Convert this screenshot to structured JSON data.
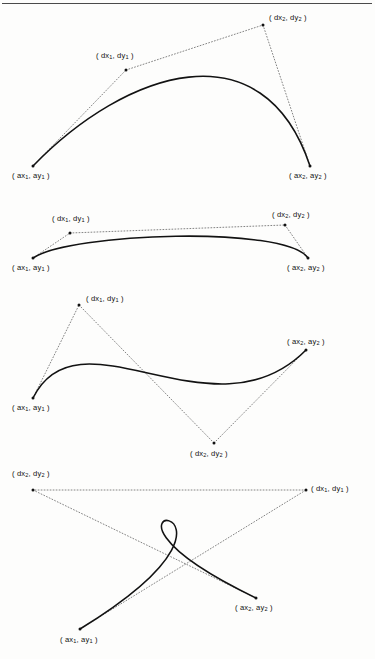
{
  "page": {
    "background_color": "#fdfdfc",
    "ink_color": "#121212",
    "has_top_rule": true
  },
  "labels": {
    "anchor1": "( ax<sub>1</sub>, ay<sub>1</sub> )",
    "anchor2": "( ax<sub>2</sub>, ay<sub>2</sub> )",
    "control1": "( dx<sub>1</sub>, dy<sub>1</sub> )",
    "control2": "( dx<sub>2</sub>, dy<sub>2</sub> )"
  },
  "figures": [
    {
      "id": "figure-1",
      "name": "arch-curve",
      "description": "Bezier arch with both control points above the curve",
      "points": {
        "anchor1": [
          33,
          166
        ],
        "control1": [
          126,
          70
        ],
        "control2": [
          263,
          25
        ],
        "anchor2": [
          310,
          166
        ]
      },
      "label_positions": {
        "anchor1": [
          12,
          172
        ],
        "control1": [
          96,
          52
        ],
        "control2": [
          269,
          14
        ],
        "anchor2": [
          289,
          172
        ]
      },
      "curve_path": "M 33 166 C 126 70 263 25 310 166",
      "tangent1": "M 33 166 L 126 70",
      "hull_line": "M 126 70 L 263 25",
      "tangent2": "M 263 25 L 310 166"
    },
    {
      "id": "figure-2",
      "name": "shallow-arc-curve",
      "description": "Shallow Bezier arc with control points just above the endpoints",
      "points": {
        "anchor1": [
          33,
          258
        ],
        "control1": [
          70,
          233
        ],
        "control2": [
          285,
          225
        ],
        "anchor2": [
          308,
          258
        ]
      },
      "label_positions": {
        "anchor1": [
          12,
          264
        ],
        "control1": [
          52,
          215
        ],
        "control2": [
          272,
          211
        ],
        "anchor2": [
          287,
          264
        ]
      },
      "curve_path": "M 33 258 C 70 233 285 225 308 258",
      "tangent1": "M 33 258 L 70 233",
      "hull_line": "M 70 233 L 285 225",
      "tangent2": "M 285 225 L 308 258"
    },
    {
      "id": "figure-3",
      "name": "s-curve",
      "description": "S-shaped Bezier with first control point above and second control point below",
      "points": {
        "anchor1": [
          33,
          398
        ],
        "control1": [
          79,
          305
        ],
        "control2": [
          214,
          443
        ],
        "anchor2": [
          306,
          350
        ]
      },
      "label_positions": {
        "anchor1": [
          12,
          404
        ],
        "control1": [
          86,
          295
        ],
        "control2": [
          190,
          450
        ],
        "anchor2": [
          287,
          338
        ]
      },
      "curve_path": "M 33 398 C 79 305 214 443 306 350",
      "tangent1": "M 33 398 L 79 305",
      "hull_line": "M 79 305 L 214 443",
      "tangent2": "M 214 443 L 306 350"
    },
    {
      "id": "figure-4",
      "name": "looped-curve",
      "description": "Self-intersecting looped Bezier with crossed control polygon",
      "points": {
        "anchor1": [
          80,
          629
        ],
        "control1": [
          306,
          490
        ],
        "control2": [
          33,
          490
        ],
        "anchor2": [
          256,
          598
        ]
      },
      "label_positions": {
        "anchor1": [
          60,
          636
        ],
        "control1": [
          311,
          485
        ],
        "control2": [
          12,
          470
        ],
        "anchor2": [
          235,
          604
        ]
      },
      "curve_path": "M 80 629 C 306 490 33 490 256 598",
      "tangent1": "M 80 629 L 306 490",
      "hull_line": "M 306 490 L 33 490",
      "tangent2": "M 33 490 L 256 598"
    }
  ]
}
